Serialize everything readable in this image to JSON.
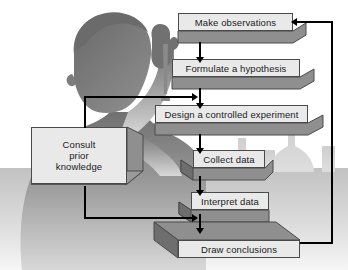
{
  "diagram": {
    "colors": {
      "box_fill": "#e9e9e9",
      "box_border": "#4a4a4a",
      "box_shadow_face": "#8f8f8f",
      "box_shadow_dark": "#6e6e6e",
      "connector": "#000000",
      "background": "#ffffff",
      "silhouette_dark": "#6e6e6e",
      "silhouette_light": "#c9c9c9",
      "table_gradient_top": "#c6c6c6",
      "table_gradient_bottom": "#f4f4f4"
    },
    "nodes": [
      {
        "id": "make-observations",
        "label": "Make observations",
        "shape": "bevel-right"
      },
      {
        "id": "formulate-hypothesis",
        "label": "Formulate a hypothesis",
        "shape": "bevel-right"
      },
      {
        "id": "design-experiment",
        "label": "Design a controlled experiment",
        "shape": "bevel-right"
      },
      {
        "id": "collect-data",
        "label": "Collect data",
        "shape": "bevel-left-right"
      },
      {
        "id": "interpret-data",
        "label": "Interpret data",
        "shape": "bevel-left"
      },
      {
        "id": "draw-conclusions",
        "label": "Draw conclusions",
        "shape": "bevel-top-left"
      },
      {
        "id": "consult-prior-knowledge",
        "label": "Consult\nprior\nknowledge",
        "label_lines": [
          "Consult",
          "prior",
          "knowledge"
        ],
        "shape": "bevel-right-bottom"
      }
    ],
    "connections": [
      {
        "from": "make-observations",
        "to": "formulate-hypothesis",
        "kind": "down-arrow"
      },
      {
        "from": "formulate-hypothesis",
        "to": "design-experiment",
        "kind": "down-arrow"
      },
      {
        "from": "design-experiment",
        "to": "collect-data",
        "kind": "down-arrow"
      },
      {
        "from": "collect-data",
        "to": "interpret-data",
        "kind": "down-arrow"
      },
      {
        "from": "interpret-data",
        "to": "draw-conclusions",
        "kind": "down-arrow"
      },
      {
        "from": "consult-prior-knowledge",
        "to": "design-experiment",
        "kind": "elbow-up-right-arrow"
      },
      {
        "from": "consult-prior-knowledge",
        "to": "draw-conclusions",
        "kind": "elbow-down-right-arrow"
      },
      {
        "from": "draw-conclusions",
        "to": "make-observations",
        "kind": "feedback-loop-right"
      }
    ],
    "background_scene": {
      "figure": "scientist-silhouette",
      "props": [
        "pipette",
        "flask-large",
        "flask-round",
        "beaker-small",
        "beaker-tall",
        "lab-bench"
      ]
    }
  }
}
